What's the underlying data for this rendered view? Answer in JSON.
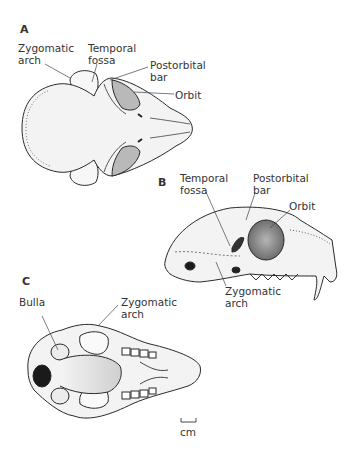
{
  "figure": {
    "panels": [
      {
        "id": "A",
        "view": "dorsal",
        "labels": [
          {
            "text": "Zygomatic\narch",
            "line1": "Zygomatic",
            "line2": "arch"
          },
          {
            "text": "Temporal\nfossa",
            "line1": "Temporal",
            "line2": "fossa"
          },
          {
            "text": "Postorbital\nbar",
            "line1": "Postorbital",
            "line2": "bar"
          },
          {
            "text": "Orbit",
            "line1": "Orbit"
          }
        ]
      },
      {
        "id": "B",
        "view": "lateral",
        "labels": [
          {
            "line1": "Temporal",
            "line2": "fossa"
          },
          {
            "line1": "Postorbital",
            "line2": "bar"
          },
          {
            "line1": "Orbit"
          },
          {
            "line1": "Zygomatic",
            "line2": "arch"
          }
        ]
      },
      {
        "id": "C",
        "view": "ventral",
        "labels": [
          {
            "line1": "Bulla"
          },
          {
            "line1": "Zygomatic",
            "line2": "arch"
          }
        ]
      }
    ],
    "scale_bar": {
      "unit": "cm"
    },
    "colors": {
      "outline": "#2a2a2a",
      "bone_fill": "#f2f2f2",
      "shade": "#9a9a9a",
      "orbit_fill": "#8c8c8c",
      "foramen": "#1a1a1a"
    }
  }
}
